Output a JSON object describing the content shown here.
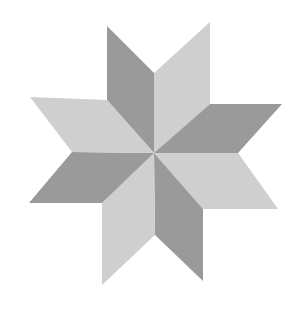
{
  "figure": {
    "colors": {
      "dark": "#9a9a9a",
      "light": "#cfcfcf",
      "background": "#ffffff"
    },
    "rhombi": [
      {
        "name": "rhombus-top-left",
        "shade": "dark",
        "points": "154,153 154,73 107,26 107,100"
      },
      {
        "name": "rhombus-top-right",
        "shade": "light",
        "points": "154,153 154,73 210,22 210,104"
      },
      {
        "name": "rhombus-right",
        "shade": "dark",
        "points": "154,153 210,104 282,104 238,153"
      },
      {
        "name": "rhombus-lower-right",
        "shade": "light",
        "points": "154,153 238,153 278,209 203,209"
      },
      {
        "name": "rhombus-bottom-right",
        "shade": "dark",
        "points": "154,153 203,209 203,281 155,235"
      },
      {
        "name": "rhombus-bottom-left",
        "shade": "light",
        "points": "154,153 155,235 102,285 102,203"
      },
      {
        "name": "rhombus-left",
        "shade": "dark",
        "points": "154,153 102,203 29,203 72,152"
      },
      {
        "name": "rhombus-upper-left",
        "shade": "light",
        "points": "154,153 72,152 30,97 107,100"
      }
    ]
  }
}
